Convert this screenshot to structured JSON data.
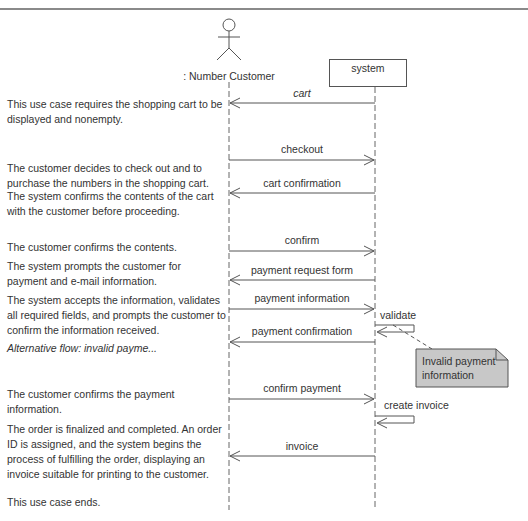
{
  "diagram": {
    "type": "sequence-diagram",
    "participants": [
      {
        "id": "customer",
        "kind": "actor",
        "label": ": Number Customer"
      },
      {
        "id": "system",
        "kind": "object",
        "label": "system"
      }
    ],
    "messages": [
      {
        "label": "cart",
        "from": "system",
        "to": "customer",
        "italic": true
      },
      {
        "label": "checkout",
        "from": "customer",
        "to": "system"
      },
      {
        "label": "cart confirmation",
        "from": "system",
        "to": "customer"
      },
      {
        "label": "confirm",
        "from": "customer",
        "to": "system"
      },
      {
        "label": "payment request form",
        "from": "system",
        "to": "customer"
      },
      {
        "label": "payment information",
        "from": "customer",
        "to": "system"
      },
      {
        "label": "validate",
        "from": "system",
        "to": "system",
        "self": true
      },
      {
        "label": "payment confirmation",
        "from": "system",
        "to": "customer"
      },
      {
        "label": "confirm payment",
        "from": "customer",
        "to": "system"
      },
      {
        "label": "create invoice",
        "from": "system",
        "to": "system",
        "self": true
      },
      {
        "label": "invoice",
        "from": "system",
        "to": "customer"
      }
    ],
    "note": {
      "line1": "Invalid payment",
      "line2": "information",
      "attached_to": "validate",
      "fill": "#c8c8c8"
    },
    "steps": [
      "This use case requires the shopping cart to be displayed and nonempty.",
      "The customer decides to check out and to purchase the numbers in the shopping cart.",
      "The system confirms the contents of the cart with the customer before proceeding.",
      "The customer confirms the contents.",
      "The system prompts the customer for payment and e-mail information.",
      "The system accepts the information, validates all required fields, and prompts the customer to confirm the information received.",
      "Alternative flow: invalid payme...",
      "The customer confirms the payment information.",
      "The order is finalized and completed.  An order ID is assigned, and the system begins the process of fulfilling the order, displaying an invoice suitable for printing to the customer.",
      "This use case ends."
    ]
  },
  "colors": {
    "line": "#555555",
    "rule": "#8a8a8a",
    "note_fill": "#c8c8c8"
  }
}
